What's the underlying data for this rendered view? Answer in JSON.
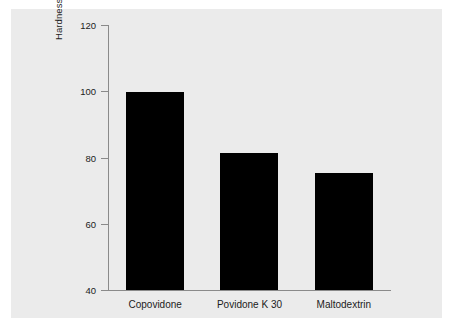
{
  "chart_data": {
    "type": "bar",
    "title": "",
    "subtitle": "",
    "xlabel": "",
    "ylabel": "Hardness, N",
    "categories": [
      "Copovidone",
      "Povidone K 30",
      "Maltodextrin"
    ],
    "values": [
      99.8,
      81.5,
      75.2
    ],
    "ylim": [
      40,
      120
    ],
    "yticks": [
      40,
      60,
      80,
      100,
      120
    ],
    "ytick_labels": [
      "40",
      "60",
      "80",
      "100",
      "120"
    ],
    "grid": false,
    "legend": null,
    "legend_position": "none",
    "series": [
      {
        "name": "Hardness",
        "values": [
          99.8,
          81.5,
          75.2
        ]
      }
    ],
    "bar_color": "#000000",
    "panel_color": "#ebebeb",
    "axis_color": "#8a8a8a",
    "text_color": "#1b1b1b"
  }
}
